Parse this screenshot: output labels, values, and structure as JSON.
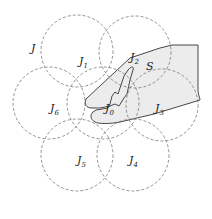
{
  "diagram": {
    "outer_label": "J",
    "region_label": "S",
    "circles": [
      {
        "id": "J0",
        "name": "J",
        "sub": "0",
        "cx": 103,
        "cy": 103,
        "r": 36
      },
      {
        "id": "J1",
        "name": "J",
        "sub": "1",
        "cx": 77,
        "cy": 51,
        "r": 36
      },
      {
        "id": "J2",
        "name": "J",
        "sub": "2",
        "cx": 135,
        "cy": 52,
        "r": 36
      },
      {
        "id": "J3",
        "name": "J",
        "sub": "3",
        "cx": 162,
        "cy": 105,
        "r": 36
      },
      {
        "id": "J4",
        "name": "J",
        "sub": "4",
        "cx": 133,
        "cy": 155,
        "r": 36
      },
      {
        "id": "J5",
        "name": "J",
        "sub": "5",
        "cx": 77,
        "cy": 155,
        "r": 36
      },
      {
        "id": "J6",
        "name": "J",
        "sub": "6",
        "cx": 49,
        "cy": 103,
        "r": 36
      }
    ],
    "labels": {
      "J": "J",
      "J1": "1",
      "J2": "2",
      "J3": "3",
      "J4": "4",
      "J5": "5",
      "J6": "6",
      "J0": "0",
      "base": "J",
      "S": "S"
    }
  }
}
